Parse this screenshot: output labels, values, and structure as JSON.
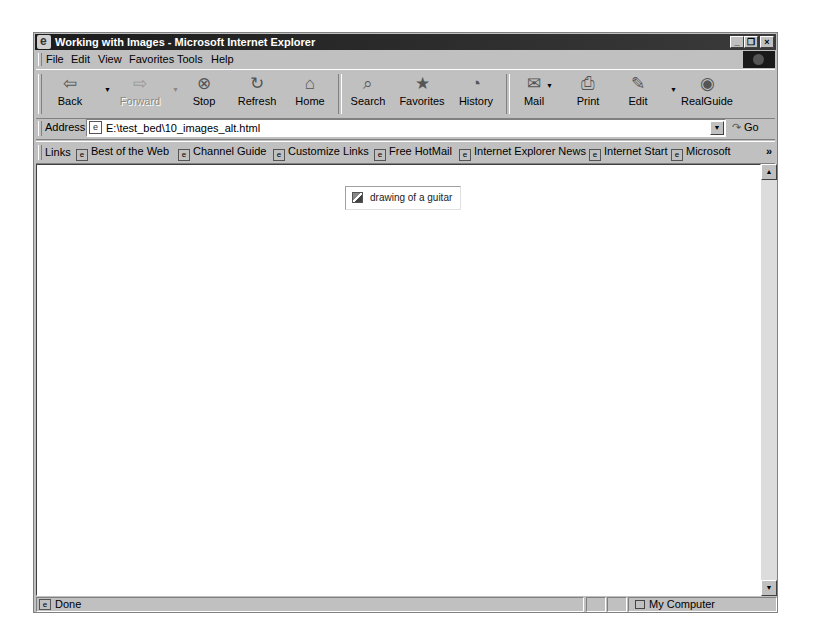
{
  "window": {
    "title": "Working with Images - Microsoft Internet Explorer",
    "controls": {
      "minimize": "_",
      "restore": "❐",
      "close": "×"
    }
  },
  "menubar": {
    "items": [
      {
        "label": "File",
        "accel": "F"
      },
      {
        "label": "Edit",
        "accel": "E"
      },
      {
        "label": "View",
        "accel": "V"
      },
      {
        "label": "Favorites",
        "accel": "a"
      },
      {
        "label": "Tools",
        "accel": "T"
      },
      {
        "label": "Help",
        "accel": "H"
      }
    ]
  },
  "toolbar": {
    "buttons": [
      {
        "id": "back",
        "label": "Back",
        "icon": "⇦",
        "enabled": true
      },
      {
        "id": "forward",
        "label": "Forward",
        "icon": "⇨",
        "enabled": false
      },
      {
        "id": "stop",
        "label": "Stop",
        "icon": "⊗",
        "enabled": true
      },
      {
        "id": "refresh",
        "label": "Refresh",
        "icon": "↻",
        "enabled": true
      },
      {
        "id": "home",
        "label": "Home",
        "icon": "⌂",
        "enabled": true
      },
      {
        "id": "search",
        "label": "Search",
        "icon": "⌕",
        "enabled": true
      },
      {
        "id": "favorites",
        "label": "Favorites",
        "icon": "★",
        "enabled": true
      },
      {
        "id": "history",
        "label": "History",
        "icon": "◔",
        "enabled": true
      },
      {
        "id": "mail",
        "label": "Mail",
        "icon": "✉",
        "enabled": true
      },
      {
        "id": "print",
        "label": "Print",
        "icon": "⎙",
        "enabled": true
      },
      {
        "id": "edit",
        "label": "Edit",
        "icon": "✎",
        "enabled": true
      },
      {
        "id": "realguide",
        "label": "RealGuide",
        "icon": "◉",
        "enabled": true
      }
    ]
  },
  "addressbar": {
    "label": "Address",
    "value": "E:\\test_bed\\10_images_alt.html",
    "go_label": "Go"
  },
  "linksbar": {
    "label": "Links",
    "links": [
      "Best of the Web",
      "Channel Guide",
      "Customize Links",
      "Free HotMail",
      "Internet Explorer News",
      "Internet Start",
      "Microsoft"
    ],
    "overflow": "»"
  },
  "content": {
    "image_alt": "drawing of a guitar"
  },
  "statusbar": {
    "status": "Done",
    "zone": "My Computer"
  }
}
